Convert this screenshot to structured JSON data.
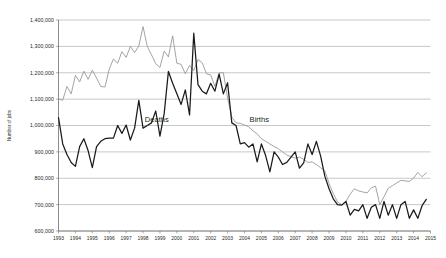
{
  "chart_data": {
    "type": "line",
    "title": "",
    "xlabel": "",
    "ylabel": "Number of jobs",
    "ylim": [
      600000,
      1400000
    ],
    "xlim": [
      1993,
      2015
    ],
    "grid": true,
    "legend_position": "inline-annotations",
    "ytick_labels": [
      "1,400,000",
      "1,300,000",
      "1,200,000",
      "1,100,000",
      "1,000,000",
      "900,000",
      "800,000",
      "700,000",
      "600,000"
    ],
    "ytick_values": [
      1400000,
      1300000,
      1200000,
      1100000,
      1000000,
      900000,
      800000,
      700000,
      600000
    ],
    "xtick_labels": [
      "1993",
      "1994",
      "1995",
      "1996",
      "1997",
      "1998",
      "1999",
      "2000",
      "2001",
      "2002",
      "2003",
      "2004",
      "2005",
      "2006",
      "2007",
      "2008",
      "2009",
      "2010",
      "2011",
      "2012",
      "2013",
      "2014",
      "2015"
    ],
    "xtick_values": [
      1993,
      1994,
      1995,
      1996,
      1997,
      1998,
      1999,
      2000,
      2001,
      2002,
      2003,
      2004,
      2005,
      2006,
      2007,
      2008,
      2009,
      2010,
      2011,
      2012,
      2013,
      2014,
      2015
    ],
    "annotations": [
      {
        "text": "Deaths",
        "x": 1998.1,
        "y": 1012000
      },
      {
        "text": "Births",
        "x": 2004.3,
        "y": 1012000
      }
    ],
    "series": [
      {
        "name": "Births",
        "color": "#9a9a9a",
        "x": [
          1993.0,
          1993.25,
          1993.5,
          1993.75,
          1994.0,
          1994.25,
          1994.5,
          1994.75,
          1995.0,
          1995.25,
          1995.5,
          1995.75,
          1996.0,
          1996.25,
          1996.5,
          1996.75,
          1997.0,
          1997.25,
          1997.5,
          1997.75,
          1998.0,
          1998.25,
          1998.5,
          1998.75,
          1999.0,
          1999.25,
          1999.5,
          1999.75,
          2000.0,
          2000.25,
          2000.5,
          2000.75,
          2001.0,
          2001.25,
          2001.5,
          2001.75,
          2002.0,
          2002.25,
          2002.5,
          2002.75,
          2003.0,
          2003.25,
          2003.5,
          2003.75,
          2004.0,
          2004.25,
          2004.5,
          2004.75,
          2005.0,
          2005.25,
          2005.5,
          2005.75,
          2006.0,
          2006.25,
          2006.5,
          2006.75,
          2007.0,
          2007.25,
          2007.5,
          2007.75,
          2008.0,
          2008.25,
          2008.5,
          2008.75,
          2009.0,
          2009.25,
          2009.5,
          2009.75,
          2010.0,
          2010.25,
          2010.5,
          2010.75,
          2011.0,
          2011.25,
          2011.5,
          2011.75,
          2012.0,
          2012.25,
          2012.5,
          2012.75,
          2013.0,
          2013.25,
          2013.5,
          2013.75,
          2014.0,
          2014.25,
          2014.5,
          2014.75
        ],
        "values": [
          1100000,
          1096000,
          1148000,
          1120000,
          1190000,
          1165000,
          1206000,
          1175000,
          1210000,
          1180000,
          1148000,
          1146000,
          1214000,
          1252000,
          1236000,
          1280000,
          1258000,
          1300000,
          1276000,
          1302000,
          1375000,
          1300000,
          1268000,
          1234000,
          1220000,
          1282000,
          1260000,
          1340000,
          1236000,
          1232000,
          1196000,
          1228000,
          1208000,
          1250000,
          1238000,
          1196000,
          1192000,
          1148000,
          1200000,
          1200000,
          1104000,
          1032000,
          1010000,
          1008000,
          1002000,
          995000,
          980000,
          968000,
          950000,
          940000,
          930000,
          920000,
          912000,
          900000,
          888000,
          882000,
          876000,
          880000,
          872000,
          860000,
          862000,
          852000,
          840000,
          828000,
          780000,
          742000,
          710000,
          700000,
          712000,
          740000,
          760000,
          752000,
          748000,
          744000,
          764000,
          770000,
          700000,
          730000,
          762000,
          772000,
          782000,
          792000,
          790000,
          788000,
          800000,
          822000,
          806000,
          820000
        ]
      },
      {
        "name": "Deaths",
        "color": "#1a1a1a",
        "x": [
          1993.0,
          1993.25,
          1993.5,
          1993.75,
          1994.0,
          1994.25,
          1994.5,
          1994.75,
          1995.0,
          1995.25,
          1995.5,
          1995.75,
          1996.0,
          1996.25,
          1996.5,
          1996.75,
          1997.0,
          1997.25,
          1997.5,
          1997.75,
          1998.0,
          1998.25,
          1998.5,
          1998.75,
          1999.0,
          1999.25,
          1999.5,
          1999.75,
          2000.0,
          2000.25,
          2000.5,
          2000.75,
          2001.0,
          2001.25,
          2001.5,
          2001.75,
          2002.0,
          2002.25,
          2002.5,
          2002.75,
          2003.0,
          2003.25,
          2003.5,
          2003.75,
          2004.0,
          2004.25,
          2004.5,
          2004.75,
          2005.0,
          2005.25,
          2005.5,
          2005.75,
          2006.0,
          2006.25,
          2006.5,
          2006.75,
          2007.0,
          2007.25,
          2007.5,
          2007.75,
          2008.0,
          2008.25,
          2008.5,
          2008.75,
          2009.0,
          2009.25,
          2009.5,
          2009.75,
          2010.0,
          2010.25,
          2010.5,
          2010.75,
          2011.0,
          2011.25,
          2011.5,
          2011.75,
          2012.0,
          2012.25,
          2012.5,
          2012.75,
          2013.0,
          2013.25,
          2013.5,
          2013.75,
          2014.0,
          2014.25,
          2014.5,
          2014.75
        ],
        "values": [
          1030000,
          930000,
          890000,
          860000,
          845000,
          920000,
          950000,
          905000,
          840000,
          920000,
          940000,
          950000,
          952000,
          952000,
          1000000,
          970000,
          1002000,
          945000,
          990000,
          1095000,
          990000,
          1000000,
          1010000,
          1055000,
          960000,
          1045000,
          1205000,
          1160000,
          1120000,
          1080000,
          1135000,
          1040000,
          1350000,
          1155000,
          1130000,
          1120000,
          1160000,
          1130000,
          1195000,
          1120000,
          1162000,
          1010000,
          1000000,
          930000,
          935000,
          918000,
          930000,
          862000,
          930000,
          886000,
          824000,
          900000,
          880000,
          852000,
          860000,
          880000,
          900000,
          838000,
          858000,
          930000,
          890000,
          940000,
          885000,
          808000,
          760000,
          722000,
          700000,
          698000,
          712000,
          660000,
          682000,
          676000,
          700000,
          648000,
          690000,
          700000,
          648000,
          712000,
          660000,
          700000,
          648000,
          700000,
          712000,
          648000,
          680000,
          648000,
          696000,
          720000
        ]
      }
    ]
  }
}
